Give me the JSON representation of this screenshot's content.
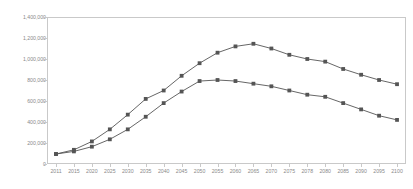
{
  "chart_data": {
    "type": "line",
    "title": "",
    "subtitle": "",
    "xlabel": "",
    "ylabel": "",
    "grid": false,
    "legend": "none",
    "ylim": [
      0,
      1400000
    ],
    "yticks": [
      "0",
      "200,000",
      "400,000",
      "600,000",
      "800,000",
      "1,000,000",
      "1,200,000",
      "1,400,000"
    ],
    "ytick_values": [
      0,
      200000,
      400000,
      600000,
      800000,
      1000000,
      1200000,
      1400000
    ],
    "categories": [
      "2011",
      "2015",
      "2020",
      "2025",
      "2030",
      "2035",
      "2040",
      "2045",
      "2050",
      "2055",
      "2060",
      "2065",
      "2070",
      "2075",
      "2078",
      "2080",
      "2085",
      "2090",
      "2095",
      "2100"
    ],
    "series": [
      {
        "name": "Series 1",
        "marker": "square",
        "color": "#555555",
        "values": [
          95000,
          135000,
          215000,
          330000,
          470000,
          620000,
          700000,
          840000,
          960000,
          1060000,
          1120000,
          1145000,
          1100000,
          1040000,
          1000000,
          975000,
          905000,
          850000,
          800000,
          760000
        ]
      },
      {
        "name": "Series 2",
        "marker": "square",
        "color": "#555555",
        "values": [
          95000,
          120000,
          165000,
          235000,
          330000,
          450000,
          580000,
          690000,
          790000,
          800000,
          790000,
          765000,
          740000,
          700000,
          660000,
          640000,
          580000,
          520000,
          460000,
          420000
        ]
      }
    ]
  },
  "axis": {
    "y_tick_color": "#8a8a8a",
    "x_tick_color": "#8a8a8a",
    "frame_color": "#c9c9c9"
  }
}
